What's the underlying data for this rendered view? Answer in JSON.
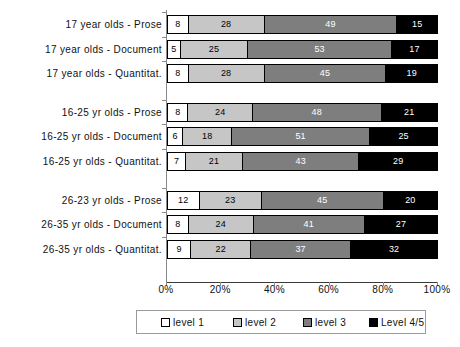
{
  "chart_data": {
    "type": "bar",
    "orientation": "horizontal",
    "stacked": true,
    "stacked_mode": "percent",
    "title": "",
    "xlabel": "",
    "ylabel": "",
    "xlim": [
      0,
      100
    ],
    "grid": false,
    "legend_position": "bottom",
    "xtick_labels": [
      "0%",
      "20%",
      "40%",
      "60%",
      "80%",
      "100%"
    ],
    "xtick_values": [
      0,
      20,
      40,
      60,
      80,
      100
    ],
    "series": [
      {
        "name": "level 1",
        "key": "lv1",
        "color": "#ffffff",
        "values": [
          8,
          5,
          8,
          8,
          6,
          7,
          12,
          8,
          9
        ]
      },
      {
        "name": "level 2",
        "key": "lv2",
        "color": "#c6c6c6",
        "values": [
          28,
          25,
          28,
          24,
          18,
          21,
          23,
          24,
          22
        ]
      },
      {
        "name": "level 3",
        "key": "lv3",
        "color": "#7e7e7e",
        "values": [
          49,
          53,
          45,
          48,
          51,
          43,
          45,
          41,
          37
        ]
      },
      {
        "name": "Level 4/5",
        "key": "lv4",
        "color": "#000000",
        "values": [
          15,
          17,
          19,
          21,
          25,
          29,
          20,
          27,
          32
        ]
      }
    ],
    "categories": [
      "17 year olds - Prose",
      "17 year olds - Document",
      "17 year olds - Quantitat.",
      "16-25 yr olds - Prose",
      "16-25 yr olds - Document",
      "16-25 yr olds - Quantitat.",
      "26-23 yr olds - Prose",
      "26-35 yr olds - Document",
      "26-35 yr olds - Quantitat."
    ],
    "rows": [
      {
        "category": "17 year olds - Prose",
        "lv1": 8,
        "lv2": 28,
        "lv3": 49,
        "lv4": 15
      },
      {
        "category": "17 year olds - Document",
        "lv1": 5,
        "lv2": 25,
        "lv3": 53,
        "lv4": 17
      },
      {
        "category": "17 year olds - Quantitat.",
        "lv1": 8,
        "lv2": 28,
        "lv3": 45,
        "lv4": 19
      },
      {
        "category": "16-25 yr olds - Prose",
        "lv1": 8,
        "lv2": 24,
        "lv3": 48,
        "lv4": 21
      },
      {
        "category": "16-25 yr olds - Document",
        "lv1": 6,
        "lv2": 18,
        "lv3": 51,
        "lv4": 25
      },
      {
        "category": "16-25 yr olds - Quantitat.",
        "lv1": 7,
        "lv2": 21,
        "lv3": 43,
        "lv4": 29
      },
      {
        "category": "26-23 yr olds - Prose",
        "lv1": 12,
        "lv2": 23,
        "lv3": 45,
        "lv4": 20
      },
      {
        "category": "26-35 yr olds - Document",
        "lv1": 8,
        "lv2": 24,
        "lv3": 41,
        "lv4": 27
      },
      {
        "category": "26-35 yr olds - Quantitat.",
        "lv1": 9,
        "lv2": 22,
        "lv3": 37,
        "lv4": 32
      }
    ],
    "group_gaps_after_row_index": [
      2,
      5
    ],
    "legend": [
      {
        "label": "level 1",
        "key": "lv1",
        "color": "#ffffff"
      },
      {
        "label": "level 2",
        "key": "lv2",
        "color": "#c6c6c6"
      },
      {
        "label": "level 3",
        "key": "lv3",
        "color": "#7e7e7e"
      },
      {
        "label": "Level 4/5",
        "key": "lv4",
        "color": "#000000"
      }
    ]
  }
}
